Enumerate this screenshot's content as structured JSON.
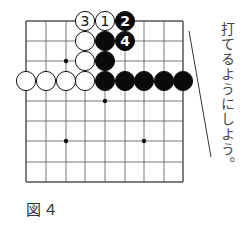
{
  "figure": {
    "caption": "図４",
    "instruction": "打てるようにしよう。"
  },
  "board": {
    "grid": {
      "xs": [
        26,
        46,
        66,
        85,
        105,
        125,
        144,
        164,
        183
      ],
      "ys": [
        21,
        41,
        61,
        81,
        101,
        121,
        141,
        162,
        182
      ],
      "line_color": "#555555"
    },
    "star_points": [
      {
        "col": 2,
        "row": 2
      },
      {
        "col": 4,
        "row": 4
      },
      {
        "col": 2,
        "row": 6
      },
      {
        "col": 6,
        "row": 6
      }
    ],
    "stones": [
      {
        "color": "white",
        "col": 3,
        "row": 0,
        "label": "3"
      },
      {
        "color": "white",
        "col": 4,
        "row": 0,
        "label": "1"
      },
      {
        "color": "black",
        "col": 5,
        "row": 0,
        "label": "2"
      },
      {
        "color": "white",
        "col": 3,
        "row": 1,
        "label": ""
      },
      {
        "color": "black",
        "col": 4,
        "row": 1,
        "label": ""
      },
      {
        "color": "black",
        "col": 5,
        "row": 1,
        "label": "4"
      },
      {
        "color": "white",
        "col": 3,
        "row": 2,
        "label": ""
      },
      {
        "color": "black",
        "col": 4,
        "row": 2,
        "label": ""
      },
      {
        "color": "white",
        "col": 0,
        "row": 3,
        "label": ""
      },
      {
        "color": "white",
        "col": 1,
        "row": 3,
        "label": ""
      },
      {
        "color": "white",
        "col": 2,
        "row": 3,
        "label": ""
      },
      {
        "color": "white",
        "col": 3,
        "row": 3,
        "label": ""
      },
      {
        "color": "black",
        "col": 4,
        "row": 3,
        "label": ""
      },
      {
        "color": "black",
        "col": 5,
        "row": 3,
        "label": ""
      },
      {
        "color": "black",
        "col": 6,
        "row": 3,
        "label": ""
      },
      {
        "color": "black",
        "col": 7,
        "row": 3,
        "label": ""
      },
      {
        "color": "black",
        "col": 8,
        "row": 3,
        "label": ""
      }
    ],
    "pointer_line": {
      "x1": 189,
      "y1": 31,
      "x2": 211,
      "y2": 157
    }
  }
}
